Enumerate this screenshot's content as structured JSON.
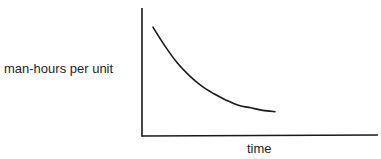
{
  "chart_data": {
    "type": "line",
    "title": "",
    "xlabel": "time",
    "ylabel": "man-hours per unit",
    "grid": false,
    "legend": null,
    "axis_ticks": false,
    "series": [
      {
        "name": "learning curve",
        "shape": "decreasing convex (exponential-like decay)",
        "x": [
          0.0,
          0.1,
          0.2,
          0.3,
          0.4,
          0.5,
          0.6,
          0.7,
          0.8,
          0.9,
          1.0
        ],
        "y": [
          0.85,
          0.7,
          0.57,
          0.47,
          0.39,
          0.33,
          0.28,
          0.24,
          0.22,
          0.2,
          0.19
        ]
      }
    ],
    "xlim": [
      0,
      2.1
    ],
    "ylim": [
      0,
      1
    ],
    "colors": {
      "axis": "#1a1a1a",
      "line": "#1a1a1a",
      "background": "#ffffff"
    }
  },
  "labels": {
    "y_axis": "man-hours per unit",
    "x_axis": "time"
  }
}
